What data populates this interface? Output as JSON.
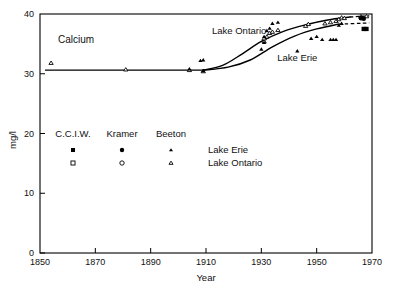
{
  "figure": {
    "title": "Calcium",
    "caption_fragment": ""
  },
  "chart_data": {
    "type": "scatter",
    "title": "Calcium",
    "xlabel": "Year",
    "ylabel": "mg/l",
    "xlim": [
      1850,
      1970
    ],
    "ylim": [
      0,
      40
    ],
    "xticks": [
      1850,
      1870,
      1890,
      1910,
      1930,
      1950,
      1970
    ],
    "yticks": [
      0,
      10,
      20,
      30,
      40
    ],
    "grid": false,
    "legend_position": "inside-lower-left",
    "annotations": [
      {
        "text": "Lake Ontario",
        "x": 1922,
        "y": 36.6
      },
      {
        "text": "Lake Erie",
        "x": 1943,
        "y": 32.2
      }
    ],
    "legend": {
      "sources": [
        "C.C.I.W.",
        "Kramer",
        "Beeton"
      ],
      "source_markers": [
        "square",
        "circle",
        "triangle"
      ],
      "rows": [
        {
          "label": "Lake Erie",
          "fill": "filled"
        },
        {
          "label": "Lake Ontario",
          "fill": "open"
        }
      ]
    },
    "series": [
      {
        "name": "Lake Ontario",
        "marker": "triangle-open",
        "points": [
          [
            1854,
            31.8
          ],
          [
            1881,
            30.7
          ],
          [
            1904,
            30.6
          ],
          [
            1909,
            30.4
          ],
          [
            1931,
            35.4
          ],
          [
            1931,
            35.9
          ],
          [
            1932,
            36.2
          ],
          [
            1933,
            36.8
          ],
          [
            1934,
            37.0
          ],
          [
            1936,
            37.3
          ],
          [
            1946,
            38.0
          ],
          [
            1947,
            38.3
          ],
          [
            1953,
            38.4
          ],
          [
            1955,
            38.6
          ],
          [
            1957,
            38.8
          ],
          [
            1958,
            39.1
          ],
          [
            1959,
            39.4
          ],
          [
            1960,
            39.3
          ],
          [
            1966,
            39.6
          ],
          [
            1968,
            39.6
          ]
        ]
      },
      {
        "name": "Lake Erie",
        "marker": "triangle-filled",
        "points": [
          [
            1904,
            30.8
          ],
          [
            1908,
            32.2
          ],
          [
            1909,
            32.3
          ],
          [
            1909,
            30.5
          ],
          [
            1930,
            34.1
          ],
          [
            1931,
            35.2
          ],
          [
            1931,
            36.2
          ],
          [
            1932,
            37.2
          ],
          [
            1933,
            37.6
          ],
          [
            1934,
            38.4
          ],
          [
            1936,
            38.6
          ],
          [
            1943,
            33.8
          ],
          [
            1948,
            35.9
          ],
          [
            1950,
            36.2
          ],
          [
            1952,
            35.7
          ],
          [
            1955,
            35.7
          ],
          [
            1956,
            35.7
          ],
          [
            1957,
            35.7
          ],
          [
            1958,
            38.1
          ],
          [
            1959,
            38.4
          ]
        ]
      },
      {
        "name": "C.C.I.W.",
        "marker": "square-filled",
        "points": [
          [
            1967,
            37.5
          ],
          [
            1968,
            37.5
          ]
        ]
      },
      {
        "name": "Kramer",
        "marker": "circle-filled",
        "points": [
          [
            1966,
            39.3
          ],
          [
            1967,
            39.2
          ]
        ]
      }
    ],
    "trend_lines": [
      {
        "name": "baseline",
        "style": "solid",
        "points": [
          [
            1852,
            30.6
          ],
          [
            1900,
            30.6
          ],
          [
            1909,
            30.6
          ]
        ]
      },
      {
        "name": "Lake Ontario trend",
        "style": "solid",
        "points": [
          [
            1909,
            30.6
          ],
          [
            1916,
            31.4
          ],
          [
            1923,
            33.3
          ],
          [
            1930,
            35.4
          ],
          [
            1938,
            37.1
          ],
          [
            1946,
            38.2
          ],
          [
            1954,
            39.0
          ],
          [
            1962,
            39.5
          ]
        ]
      },
      {
        "name": "Lake Ontario trend extension",
        "style": "dashed",
        "points": [
          [
            1962,
            39.5
          ],
          [
            1969,
            39.7
          ]
        ]
      },
      {
        "name": "Lake Erie trend",
        "style": "solid",
        "points": [
          [
            1909,
            30.6
          ],
          [
            1918,
            31.1
          ],
          [
            1926,
            32.3
          ],
          [
            1934,
            34.5
          ],
          [
            1942,
            36.3
          ],
          [
            1950,
            37.5
          ],
          [
            1958,
            38.3
          ]
        ]
      },
      {
        "name": "Lake Erie trend extension",
        "style": "dashed",
        "points": [
          [
            1958,
            38.3
          ],
          [
            1969,
            38.5
          ]
        ]
      }
    ]
  }
}
